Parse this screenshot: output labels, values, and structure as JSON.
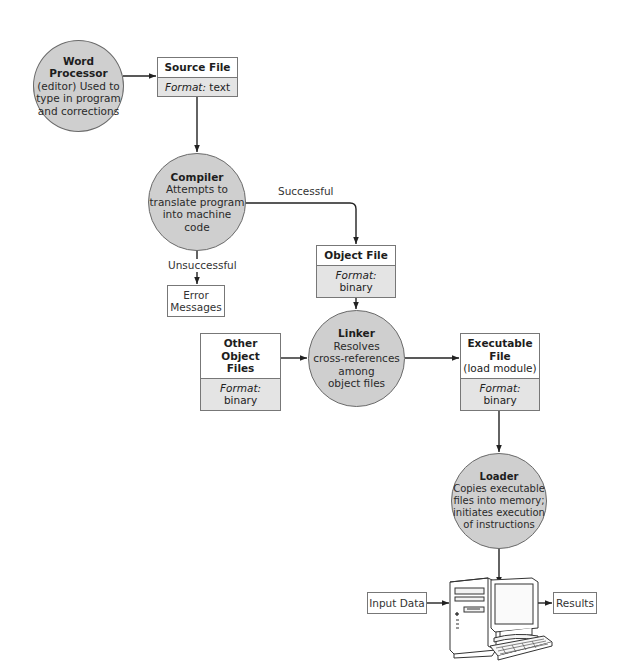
{
  "diagram": {
    "type": "flowchart",
    "nodes": {
      "word_processor": {
        "title": "Word Processor",
        "lines": [
          "(editor) Used to",
          "type in program",
          "and corrections"
        ]
      },
      "source_file": {
        "title": "Source File",
        "format_label": "Format:",
        "format_value": "text"
      },
      "compiler": {
        "title": "Compiler",
        "lines": [
          "Attempts to",
          "translate program",
          "into machine",
          "code"
        ]
      },
      "object_file": {
        "title": "Object File",
        "format_label": "Format:",
        "format_value": "binary"
      },
      "error_messages": {
        "lines": [
          "Error",
          "Messages"
        ]
      },
      "other_object_files": {
        "title_lines": [
          "Other Object",
          "Files"
        ],
        "format_label": "Format:",
        "format_value": "binary"
      },
      "linker": {
        "title": "Linker",
        "lines": [
          "Resolves",
          "cross-references",
          "among",
          "object files"
        ]
      },
      "executable_file": {
        "title": "Executable File",
        "subtitle": "(load module)",
        "format_label": "Format:",
        "format_value": "binary"
      },
      "loader": {
        "title": "Loader",
        "lines": [
          "Copies executable",
          "files into memory;",
          "initiates execution",
          "of instructions"
        ]
      },
      "input_data": {
        "label": "Input Data"
      },
      "results": {
        "label": "Results"
      },
      "computer": {
        "icon": "desktop-computer-icon"
      }
    },
    "edge_labels": {
      "successful": "Successful",
      "unsuccessful": "Unsuccessful"
    },
    "edges": [
      {
        "from": "word_processor",
        "to": "source_file"
      },
      {
        "from": "source_file",
        "to": "compiler"
      },
      {
        "from": "compiler",
        "to": "object_file",
        "label": "Successful"
      },
      {
        "from": "compiler",
        "to": "error_messages",
        "label": "Unsuccessful"
      },
      {
        "from": "object_file",
        "to": "linker"
      },
      {
        "from": "other_object_files",
        "to": "linker"
      },
      {
        "from": "linker",
        "to": "executable_file"
      },
      {
        "from": "executable_file",
        "to": "loader"
      },
      {
        "from": "loader",
        "to": "computer"
      },
      {
        "from": "input_data",
        "to": "computer"
      },
      {
        "from": "computer",
        "to": "results"
      }
    ],
    "colors": {
      "process_fill": "#cfcfcf",
      "format_fill": "#e4e4e4",
      "stroke": "#333333"
    }
  }
}
